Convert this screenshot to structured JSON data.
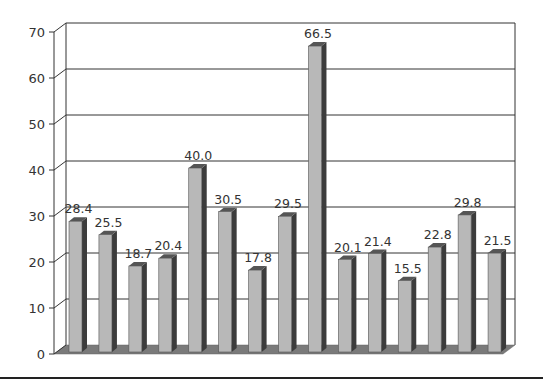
{
  "chart_data": {
    "type": "bar",
    "title": "",
    "xlabel": "",
    "ylabel": "",
    "ylim": [
      0,
      70
    ],
    "yticks": [
      0,
      10,
      20,
      30,
      40,
      50,
      60,
      70
    ],
    "ytick_labels": [
      "0",
      "10",
      "20",
      "30",
      "40",
      "50",
      "60",
      "70"
    ],
    "grid": true,
    "legend": null,
    "style": "3d-bar",
    "categories": [
      "1",
      "2",
      "3",
      "4",
      "5",
      "6",
      "7",
      "8",
      "9",
      "10",
      "11",
      "12",
      "13",
      "14",
      "15"
    ],
    "values": [
      28.4,
      25.5,
      18.7,
      20.4,
      40.0,
      30.5,
      17.8,
      29.5,
      66.5,
      20.1,
      21.4,
      15.5,
      22.8,
      29.8,
      21.5
    ],
    "value_labels": [
      "28.4",
      "25.5",
      "18.7",
      "20.4",
      "40.0",
      "30.5",
      "17.8",
      "29.5",
      "66.5",
      "20.1",
      "21.4",
      "15.5",
      "22.8",
      "29.8",
      "21.5"
    ]
  },
  "colors": {
    "bar_front": "#b8b8b8",
    "bar_side": "#3c3c3c",
    "bar_top": "#555555",
    "floor": "#7a7a7a",
    "gridline": "#333333",
    "axis": "#333333",
    "background": "#ffffff"
  }
}
